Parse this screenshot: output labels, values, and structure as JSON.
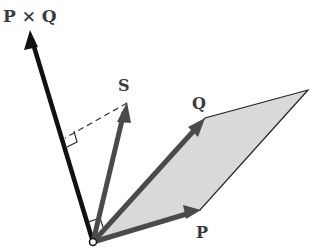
{
  "diagram": {
    "labels": {
      "cross": "P × Q",
      "s": "S",
      "q": "Q",
      "p": "P"
    },
    "colors": {
      "cross_vector": "#111111",
      "vectors": "#4a4a4a",
      "parallelogram_fill": "#d9d9d9",
      "parallelogram_edge": "#222222",
      "dashed": "#333333"
    },
    "points": {
      "origin": [
        93,
        242
      ],
      "cross_tip": [
        30,
        32
      ],
      "s_tip": [
        127,
        103
      ],
      "q_tip": [
        205,
        118
      ],
      "p_tip": [
        200,
        210
      ],
      "far_vertex": [
        308,
        90
      ],
      "foot": [
        65,
        138
      ]
    }
  }
}
